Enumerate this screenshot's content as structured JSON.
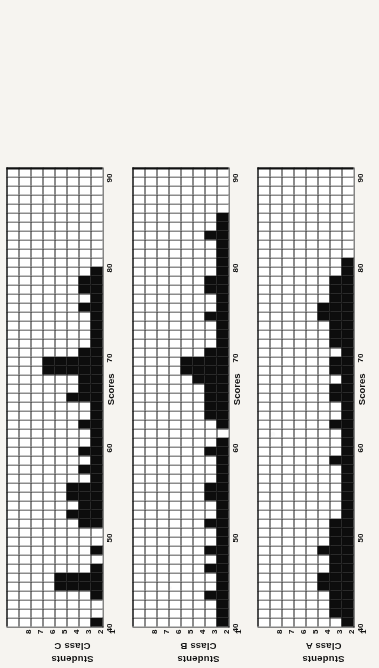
{
  "figure": {
    "orientation": "rotated-90-ccw",
    "xlabel": "Scores",
    "ylabel": "Students",
    "x_ticks": [
      "40",
      "50",
      "60",
      "70",
      "80",
      "90"
    ],
    "y_ticks": [
      "1",
      "2",
      "3",
      "4",
      "5",
      "6",
      "7",
      "8"
    ],
    "panels": [
      {
        "name": "Class C",
        "label": "Class C"
      },
      {
        "name": "Class B",
        "label": "Class B"
      },
      {
        "name": "Class A",
        "label": "Class A"
      }
    ]
  },
  "chart_data": [
    {
      "type": "bar",
      "title": "Class C",
      "xlabel": "Scores",
      "ylabel": "Students",
      "xlim": [
        40,
        90
      ],
      "ylim": [
        0,
        8
      ],
      "grid": true,
      "legend": "none",
      "categories": [
        40,
        41,
        42,
        43,
        44,
        45,
        46,
        47,
        48,
        49,
        50,
        51,
        52,
        53,
        54,
        55,
        56,
        57,
        58,
        59,
        60,
        61,
        62,
        63,
        64,
        65,
        66,
        67,
        68,
        69,
        70,
        71,
        72,
        73,
        74,
        75,
        76,
        77,
        78,
        79,
        80,
        81,
        82,
        83,
        84,
        85,
        86,
        87,
        88,
        89,
        90
      ],
      "values": [
        1,
        0,
        0,
        1,
        4,
        4,
        1,
        0,
        1,
        0,
        0,
        2,
        3,
        2,
        3,
        3,
        1,
        2,
        1,
        2,
        1,
        1,
        2,
        1,
        1,
        3,
        2,
        2,
        5,
        5,
        2,
        1,
        1,
        1,
        1,
        2,
        1,
        2,
        2,
        1,
        0,
        0,
        0,
        0,
        0,
        0,
        0,
        0,
        0,
        0,
        0
      ]
    },
    {
      "type": "bar",
      "title": "Class B",
      "xlabel": "Scores",
      "ylabel": "Students",
      "xlim": [
        40,
        90
      ],
      "ylim": [
        0,
        8
      ],
      "grid": true,
      "legend": "none",
      "categories": [
        40,
        41,
        42,
        43,
        44,
        45,
        46,
        47,
        48,
        49,
        50,
        51,
        52,
        53,
        54,
        55,
        56,
        57,
        58,
        59,
        60,
        61,
        62,
        63,
        64,
        65,
        66,
        67,
        68,
        69,
        70,
        71,
        72,
        73,
        74,
        75,
        76,
        77,
        78,
        79,
        80,
        81,
        82,
        83,
        84,
        85,
        86,
        87,
        88,
        89,
        90
      ],
      "values": [
        1,
        1,
        1,
        2,
        1,
        1,
        2,
        1,
        2,
        1,
        1,
        2,
        1,
        1,
        2,
        2,
        1,
        1,
        1,
        2,
        1,
        0,
        1,
        2,
        2,
        2,
        2,
        3,
        4,
        4,
        2,
        1,
        1,
        1,
        2,
        1,
        1,
        2,
        2,
        1,
        1,
        1,
        1,
        2,
        1,
        1,
        0,
        0,
        0,
        0,
        0
      ]
    },
    {
      "type": "bar",
      "title": "Class A",
      "xlabel": "Scores",
      "ylabel": "Students",
      "xlim": [
        40,
        90
      ],
      "ylim": [
        0,
        8
      ],
      "grid": true,
      "legend": "none",
      "categories": [
        40,
        41,
        42,
        43,
        44,
        45,
        46,
        47,
        48,
        49,
        50,
        51,
        52,
        53,
        54,
        55,
        56,
        57,
        58,
        59,
        60,
        61,
        62,
        63,
        64,
        65,
        66,
        67,
        68,
        69,
        70,
        71,
        72,
        73,
        74,
        75,
        76,
        77,
        78,
        79,
        80,
        81,
        82,
        83,
        84,
        85,
        86,
        87,
        88,
        89,
        90
      ],
      "values": [
        1,
        2,
        2,
        2,
        3,
        3,
        2,
        2,
        3,
        2,
        2,
        2,
        1,
        1,
        1,
        1,
        1,
        1,
        2,
        1,
        1,
        1,
        2,
        1,
        1,
        2,
        2,
        1,
        2,
        2,
        1,
        2,
        2,
        2,
        3,
        3,
        2,
        2,
        2,
        1,
        1,
        0,
        0,
        0,
        0,
        0,
        0,
        0,
        0,
        0,
        0
      ]
    }
  ]
}
